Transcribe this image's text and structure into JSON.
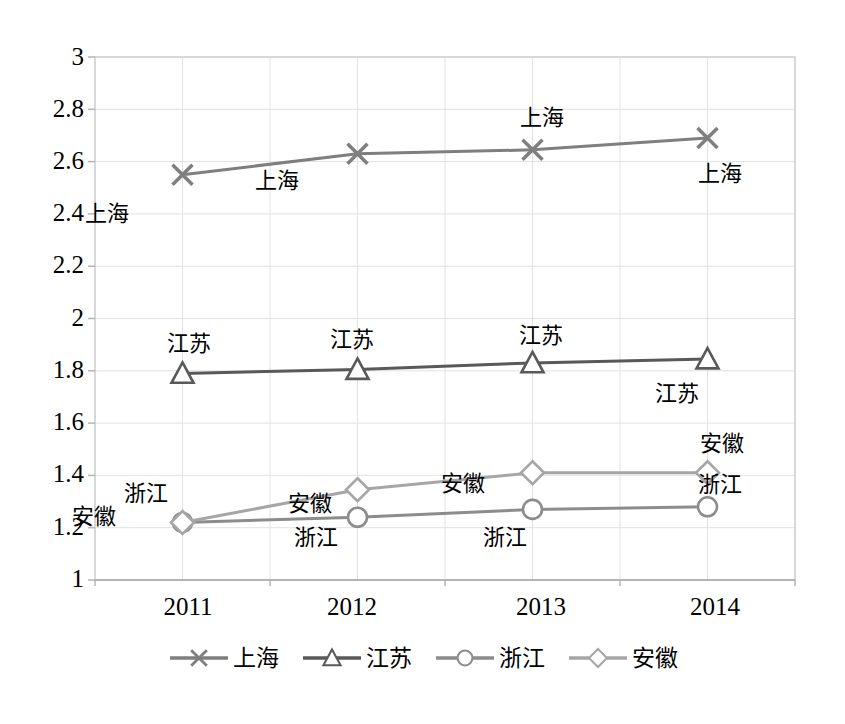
{
  "chart_data": {
    "type": "line",
    "title": "",
    "xlabel": "",
    "ylabel": "",
    "categories": [
      "2011",
      "2012",
      "2013",
      "2014"
    ],
    "ylim": [
      1,
      3
    ],
    "ytick_step": 0.2,
    "yticks": [
      "1",
      "1.2",
      "1.4",
      "1.6",
      "1.8",
      "2",
      "2.2",
      "2.4",
      "2.6",
      "2.8",
      "3"
    ],
    "grid": true,
    "legend_position": "bottom",
    "series": [
      {
        "name": "上海",
        "marker": "x-marker",
        "color": "#7f7f7f",
        "values": [
          2.55,
          2.63,
          2.645,
          2.69
        ],
        "labels": [
          "上海",
          "上海",
          "上海",
          "上海"
        ]
      },
      {
        "name": "江苏",
        "marker": "triangle-marker",
        "color": "#595959",
        "values": [
          1.79,
          1.805,
          1.83,
          1.845
        ],
        "labels": [
          "江苏",
          "江苏",
          "江苏",
          "江苏"
        ]
      },
      {
        "name": "浙江",
        "marker": "circle-marker",
        "color": "#8c8c8c",
        "values": [
          1.22,
          1.24,
          1.27,
          1.28
        ],
        "labels": [
          "浙江",
          "浙江",
          "浙江",
          "浙江"
        ]
      },
      {
        "name": "安徽",
        "marker": "diamond-marker",
        "color": "#a6a6a6",
        "values": [
          1.22,
          1.345,
          1.41,
          1.41
        ],
        "labels": [
          "安徽",
          "安徽",
          "安徽",
          "安徽"
        ]
      }
    ]
  },
  "axis": {
    "y": {
      "t0": "3",
      "t1": "2.8",
      "t2": "2.6",
      "t3": "2.4",
      "t4": "2.2",
      "t5": "2",
      "t6": "1.8",
      "t7": "1.6",
      "t8": "1.4",
      "t9": "1.2",
      "t10": "1"
    },
    "x": {
      "t0": "2011",
      "t1": "2012",
      "t2": "2013",
      "t3": "2014"
    }
  },
  "point_labels": {
    "shanghai_2011": "上海",
    "shanghai_2012": "上海",
    "shanghai_2013": "上海",
    "shanghai_2014": "上海",
    "jiangsu_2011": "江苏",
    "jiangsu_2012": "江苏",
    "jiangsu_2013": "江苏",
    "jiangsu_2014": "江苏",
    "zhejiang_2011": "浙江",
    "zhejiang_2012": "浙江",
    "zhejiang_2013": "浙江",
    "zhejiang_2014": "浙江",
    "anhui_2011": "安徽",
    "anhui_2012": "安徽",
    "anhui_2013": "安徽",
    "anhui_2014": "安徽"
  },
  "legend": {
    "items": [
      {
        "label": "上海",
        "marker": "x-marker",
        "color": "#7f7f7f"
      },
      {
        "label": "江苏",
        "marker": "triangle-marker",
        "color": "#595959"
      },
      {
        "label": "浙江",
        "marker": "circle-marker",
        "color": "#8c8c8c"
      },
      {
        "label": "安徽",
        "marker": "diamond-marker",
        "color": "#a6a6a6"
      }
    ]
  },
  "colors": {
    "plot_border": "#d0d0d0",
    "gridline": "#e2e2e2",
    "axis_line": "#b5b5b5",
    "background": "#ffffff"
  }
}
